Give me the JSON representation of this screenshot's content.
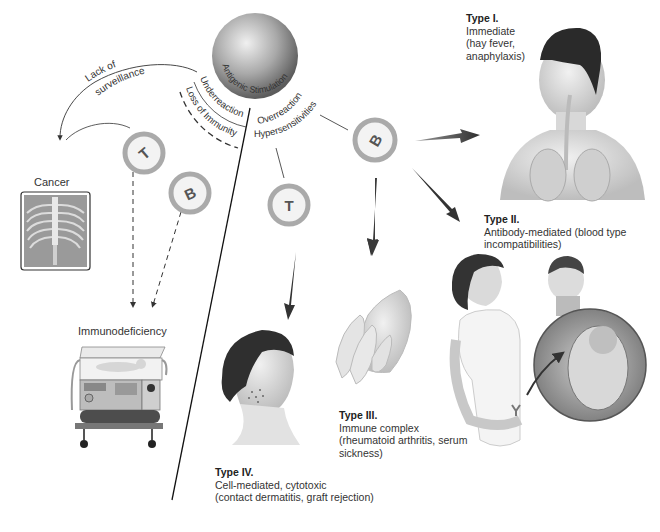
{
  "diagram": {
    "center": {
      "label": "Antigenic Stimulation"
    },
    "branches": {
      "underreaction": {
        "label": "Underreaction",
        "sub_label": "Loss of Immunity"
      },
      "overreaction": {
        "label": "Overreaction",
        "sub_label": "Hypersensitivities"
      },
      "surveillance": {
        "label_line1": "Lack of",
        "label_line2": "surveillance"
      }
    },
    "cells": [
      {
        "id": "t-cell-left",
        "letter": "T"
      },
      {
        "id": "b-cell-left",
        "letter": "B"
      },
      {
        "id": "t-cell-right",
        "letter": "T"
      },
      {
        "id": "b-cell-right",
        "letter": "B"
      }
    ],
    "outcomes": {
      "cancer": {
        "label": "Cancer"
      },
      "immunodeficiency": {
        "label": "Immunodeficiency"
      }
    },
    "hypersensitivity_types": [
      {
        "title": "Type I.",
        "line1": "Immediate",
        "line2": "(hay fever,",
        "line3": "anaphylaxis)"
      },
      {
        "title": "Type II.",
        "line1": "Antibody-mediated (blood type",
        "line2": "incompatibilities)"
      },
      {
        "title": "Type III.",
        "line1": "Immune complex",
        "line2": "(rheumatoid arthritis, serum",
        "line3": "sickness)"
      },
      {
        "title": "Type IV.",
        "line1": "Cell-mediated, cytotoxic",
        "line2": "(contact dermatitis, graft rejection)"
      }
    ],
    "colors": {
      "cell_ring": "#a8a8a8",
      "cell_inner": "#f2f2f2",
      "arrow": "#3a3a3a",
      "sphere_light": "#e6e6e6",
      "sphere_dark": "#6e6e6e"
    }
  }
}
